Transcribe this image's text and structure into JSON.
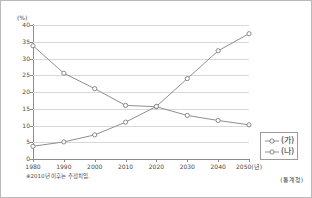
{
  "chart_data": {
    "type": "line",
    "title": "",
    "xlabel": "(년)",
    "ylabel": "(%)",
    "y_unit_label": "(%)",
    "x_axis_suffix_label": "2050(년)",
    "categories": [
      "1980",
      "1990",
      "2000",
      "2010",
      "2020",
      "2030",
      "2040",
      "2050"
    ],
    "x_tick_labels": [
      "1980",
      "1990",
      "2000",
      "2010",
      "2020",
      "2030",
      "2040",
      "2050(년)"
    ],
    "y_tick_labels": [
      "0",
      "5",
      "10",
      "15",
      "20",
      "25",
      "30",
      "35",
      "40"
    ],
    "y_ticks": [
      0,
      5,
      10,
      15,
      20,
      25,
      30,
      35,
      40
    ],
    "ylim": [
      0,
      40
    ],
    "grid": true,
    "legend_position": "right",
    "series": [
      {
        "name": "(가)",
        "values": [
          33.8,
          25.6,
          21.0,
          16.0,
          15.6,
          13.0,
          11.5,
          10.2
        ]
      },
      {
        "name": "(나)",
        "values": [
          3.8,
          5.1,
          7.2,
          11.0,
          15.7,
          24.0,
          32.3,
          37.4
        ]
      }
    ],
    "annotations": {
      "footnote": "※2010년 이후는 추정치임.",
      "source": "(통계청)"
    },
    "colors": {
      "line": "#8f8f8f",
      "marker_fill": "#ffffff",
      "marker_stroke": "#7d7d7d",
      "grid": "#d8d8d8",
      "axis": "#8c8c8c",
      "text": "#4a4a4a",
      "frame": "#b9b9b9",
      "background": "#ffffff"
    }
  },
  "legend": {
    "items": [
      {
        "label": "(가)",
        "marker": "open-circle-line-marker"
      },
      {
        "label": "(나)",
        "marker": "open-circle-line-marker"
      }
    ]
  }
}
